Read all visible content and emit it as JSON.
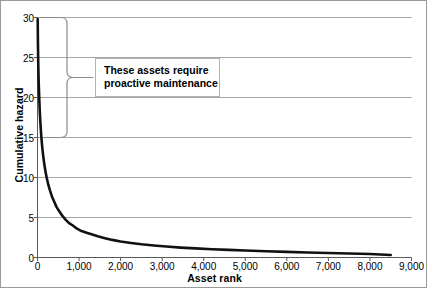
{
  "chart_data": {
    "type": "line",
    "title": "",
    "xlabel": "Asset rank",
    "ylabel": "Cumulative hazard",
    "xlim": [
      0,
      9000
    ],
    "ylim": [
      0,
      30
    ],
    "grid": true,
    "grid_axis": "y",
    "legend": false,
    "x_ticks": [
      0,
      1000,
      2000,
      3000,
      4000,
      5000,
      6000,
      7000,
      8000,
      9000
    ],
    "x_tick_labels": [
      "0",
      "1,000",
      "2,000",
      "3,000",
      "4,000",
      "5,000",
      "6,000",
      "7,000",
      "8,000",
      "9,000"
    ],
    "y_ticks": [
      0,
      5,
      10,
      15,
      20,
      25,
      30
    ],
    "y_tick_labels": [
      "0",
      "5",
      "10",
      "15",
      "20",
      "25",
      "30"
    ],
    "series": [
      {
        "name": "Cumulative hazard by asset rank",
        "style": "solid-thick-black",
        "color": "#111111",
        "x": [
          5,
          10,
          18,
          28,
          40,
          55,
          70,
          90,
          110,
          135,
          160,
          190,
          220,
          260,
          300,
          350,
          400,
          460,
          520,
          600,
          680,
          760,
          850,
          950,
          1060,
          1180,
          1300,
          1450,
          1600,
          1800,
          2000,
          2250,
          2500,
          2800,
          3100,
          3450,
          3800,
          4200,
          4600,
          5000,
          5500,
          6000,
          6500,
          7000,
          7500,
          8000,
          8500
        ],
        "y": [
          29.8,
          27.0,
          24.2,
          22.0,
          20.2,
          18.2,
          16.8,
          15.2,
          14.0,
          12.8,
          11.8,
          10.8,
          10.0,
          9.1,
          8.4,
          7.6,
          7.0,
          6.3,
          5.8,
          5.2,
          4.7,
          4.3,
          4.0,
          3.6,
          3.3,
          3.1,
          2.9,
          2.65,
          2.45,
          2.2,
          2.0,
          1.82,
          1.65,
          1.5,
          1.37,
          1.24,
          1.14,
          1.04,
          0.95,
          0.88,
          0.78,
          0.7,
          0.63,
          0.57,
          0.5,
          0.43,
          0.32
        ]
      }
    ],
    "annotations": [
      {
        "kind": "text-callout",
        "lines": [
          "These assets require",
          "proactive maintenance"
        ],
        "brace_span_y": [
          15,
          30
        ],
        "brace_at_x": 700
      }
    ]
  },
  "chart": {
    "x_axis_label": "Asset rank",
    "y_axis_label": "Cumulative hazard"
  },
  "annotation": {
    "line1": "These assets require",
    "line2": "proactive maintenance"
  },
  "colors": {
    "curve": "#111111",
    "gridline": "#a6a6a6",
    "axis": "#595959",
    "frame": "#9a9a9a",
    "brace": "#8c8c8c",
    "box_border": "#b3b3b3",
    "background": "#ffffff"
  }
}
